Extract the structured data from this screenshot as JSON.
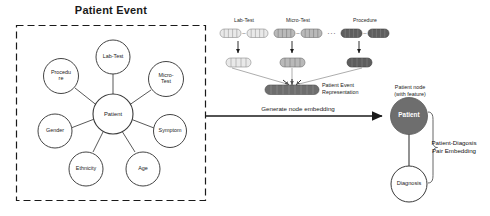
{
  "figure": {
    "title": "Patient Event",
    "background": "#ffffff"
  },
  "left_panel": {
    "title": "Patient Event",
    "border_style": "dashed",
    "border_color": "#1a1a1a",
    "center_node": {
      "label": "Patient"
    },
    "satellite_nodes": [
      {
        "label": "Lab-Test"
      },
      {
        "label": "Micro-\nTest"
      },
      {
        "label": "Symptom"
      },
      {
        "label": "Age"
      },
      {
        "label": "Ethnicity"
      },
      {
        "label": "Gender"
      },
      {
        "label": "Procedu\nre"
      }
    ]
  },
  "right_panel": {
    "event_columns": [
      {
        "label": "Lab-Test",
        "token_fill": "#e9e9e9",
        "token_stroke": "#8a8a8a",
        "agg_fill": "#e9e9e9",
        "cells": 5
      },
      {
        "label": "Micro-Test",
        "token_fill": "#b9b9b9",
        "token_stroke": "#6e6e6e",
        "agg_fill": "#b9b9b9",
        "cells": 5
      },
      {
        "label": "Procedure",
        "token_fill": "#5e5e5e",
        "token_stroke": "#3d3d3d",
        "agg_fill": "#5e5e5e",
        "cells": 5
      }
    ],
    "ellipsis": "...",
    "token_separator": "–",
    "representation": {
      "caption": "Patient Event\nRepresentation",
      "cells": 9
    },
    "embedding_arrow": {
      "label": "Generate node embedding"
    },
    "patient_node": {
      "label": "Patient",
      "caption": "Patient node\n(with feature)",
      "fill": "#6e6e6e",
      "text_color": "#ffffff"
    },
    "diagnosis_node": {
      "label": "Diagnosis",
      "fill": "#ffffff",
      "stroke": "#3a3a3a"
    },
    "pair_embedding": {
      "label": "Patient-Diagosis\nPair Embedding"
    }
  },
  "colors": {
    "ink": "#1a1a1a",
    "light_block": "#e9e9e9",
    "mid_block": "#b9b9b9",
    "dark_block": "#5e5e5e",
    "node_stroke": "#3a3a3a"
  }
}
